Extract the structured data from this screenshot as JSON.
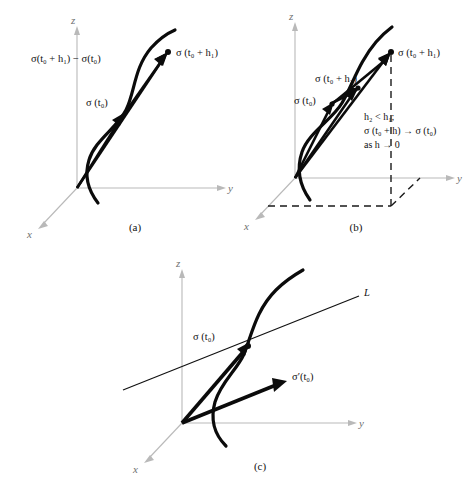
{
  "figure": {
    "background_color": "#ffffff",
    "ink_color": "#0b0b0b",
    "axis_color": "#b9b9b9",
    "panels": [
      {
        "id": "a",
        "caption": "(a)",
        "axes": {
          "x": "x",
          "y": "y",
          "z": "z"
        },
        "labels": [
          {
            "name": "secant-difference-label",
            "text": "σ(t₀ + h₁) − σ(t₀)"
          },
          {
            "name": "endpoint-label",
            "text": "σ (t₀ + h₁)"
          },
          {
            "name": "basepoint-label",
            "text": "σ (t₀)"
          }
        ]
      },
      {
        "id": "b",
        "caption": "(b)",
        "axes": {
          "x": "x",
          "y": "y",
          "z": "z"
        },
        "labels": [
          {
            "name": "endpoint-h1-label",
            "text": "σ (t₀ + h₁)"
          },
          {
            "name": "endpoint-h2-label",
            "text": "σ (t₀ + h₂)"
          },
          {
            "name": "basepoint-label",
            "text": "σ (t₀)"
          }
        ],
        "note": [
          "h₂ < h₁;",
          "σ (t₀ + h) → σ (t₀)",
          "as h → 0"
        ]
      },
      {
        "id": "c",
        "caption": "(c)",
        "axes": {
          "x": "x",
          "y": "y",
          "z": "z"
        },
        "labels": [
          {
            "name": "tangent-line-label",
            "text": "L"
          },
          {
            "name": "basepoint-label",
            "text": "σ (t₀)"
          },
          {
            "name": "derivative-vector-label",
            "text": "σ′(t₀)"
          }
        ]
      }
    ]
  },
  "panel_a": {
    "caption": "(a)",
    "axis_x": "x",
    "axis_y": "y",
    "axis_z": "z",
    "label_difference": "σ(t₀ + h₁) − σ(t₀)",
    "label_endpoint": "σ (t₀ + h₁)",
    "label_basepoint": "σ (t₀)"
  },
  "panel_b": {
    "caption": "(b)",
    "axis_x": "x",
    "axis_y": "y",
    "axis_z": "z",
    "label_endpoint_h1": "σ (t₀ + h₁)",
    "label_endpoint_h2": "σ (t₀ + h₂)",
    "label_basepoint": "σ (t₀)",
    "note_1": "h₂ < h₁;",
    "note_2": "σ (t₀ + h) → σ (t₀)",
    "note_3": "as h → 0"
  },
  "panel_c": {
    "caption": "(c)",
    "axis_x": "x",
    "axis_y": "y",
    "axis_z": "z",
    "label_line": "L",
    "label_basepoint": "σ (t₀)",
    "label_derivative": "σ′(t₀)"
  }
}
